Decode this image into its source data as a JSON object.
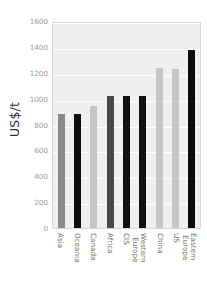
{
  "chart_data": {
    "type": "bar",
    "title": "",
    "xlabel": "",
    "ylabel": "US$/t",
    "ylim": [
      0,
      1600
    ],
    "yticks": [
      0,
      200,
      400,
      600,
      800,
      1000,
      1200,
      1400,
      1600
    ],
    "ytick_labels": [
      "0",
      "200",
      "400",
      "600",
      "800",
      "1000",
      "1200",
      "1400",
      "1600"
    ],
    "grid": true,
    "legend": "none",
    "categories": [
      "Asia",
      "Oceania",
      "Canada",
      "Africa",
      "CIS",
      "Western Europe",
      "China",
      "US",
      "Eastern Europe"
    ],
    "category_label_lines": [
      [
        "Asia"
      ],
      [
        "Oceania"
      ],
      [
        "Canada"
      ],
      [
        "Africa"
      ],
      [
        "CIS"
      ],
      [
        "Western",
        "Europe"
      ],
      [
        "China"
      ],
      [
        "US"
      ],
      [
        "Eastern",
        "Europe"
      ]
    ],
    "values": [
      880,
      880,
      940,
      1020,
      1020,
      1020,
      1235,
      1230,
      1375
    ],
    "bar_colors": [
      "#8a8a8a",
      "#0d0d0d",
      "#c4c4c4",
      "#4a4a4a",
      "#101010",
      "#101010",
      "#c7c7c7",
      "#c7c7c7",
      "#0d0d0d"
    ],
    "plot_background": "#efefef",
    "gridline_color": "#ffffff",
    "axis_border_color": "#d8d8d8",
    "tick_text_color": "#9a9a9a"
  }
}
